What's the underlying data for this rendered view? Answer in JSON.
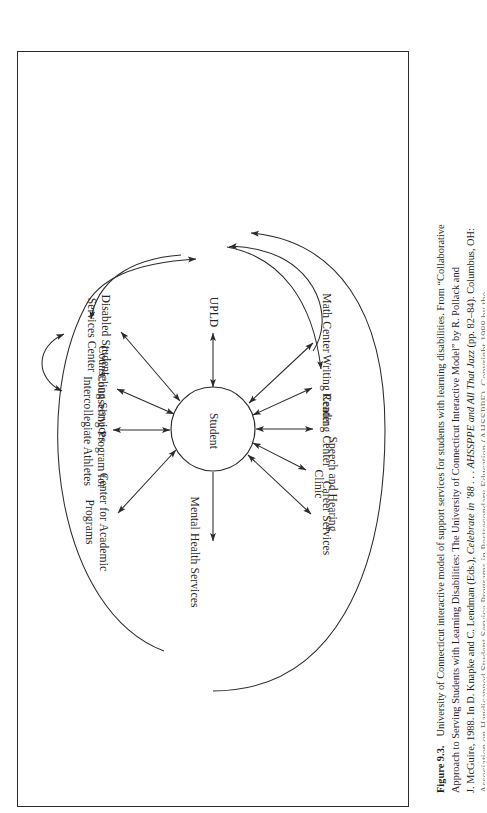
{
  "figure": {
    "number": "Figure 9.3.",
    "center_node": "Student",
    "nodes": [
      {
        "id": "upld",
        "label": "UPLD"
      },
      {
        "id": "math-center",
        "label": "Math Center"
      },
      {
        "id": "writing-center",
        "label": "Writing Center"
      },
      {
        "id": "reading-center",
        "label": "Reading Center"
      },
      {
        "id": "speech-and-hearing-clinic",
        "label": "Speech and Hearing\nClinic"
      },
      {
        "id": "career-services",
        "label": "Career Services"
      },
      {
        "id": "mental-health-services",
        "label": "Mental Health Services"
      },
      {
        "id": "disabled-student-services-center",
        "label": "Disabled Student\nServices Center"
      },
      {
        "id": "counseling-services",
        "label": "Counseling Services"
      },
      {
        "id": "counseling-program-for-intercollegiate-athletes",
        "label": "Counseling Program for\nIntercollegiate Athletes"
      },
      {
        "id": "center-for-academic-programs",
        "label": "Center for Academic\nPrograms"
      }
    ],
    "stroke_color": "#2b2b2b",
    "background_color": "#ffffff"
  },
  "caption": {
    "figure_number": "Figure 9.3.",
    "line1_a": "University of Connecticut interactive model of support services for students with learning disabilities. From “Collaborative",
    "line2": "Approach to Serving Students with Learning Disabilities: The University of Connecticut Interactive Model” by R. Pollack and",
    "line3_a": "J. McGuire, 1988. In D. Knapke and C. Lendman (Eds.), ",
    "line3_ital1": "Celebrate in ’88 . . . AHSSPPE and All That Jazz",
    "line3_b": " (pp. 82–84). Columbus, OH:",
    "line4": "Association on Handicapped Student Service Programs in Postsecondary Education (AHSSPPE). Copyright 1988 by the"
  }
}
